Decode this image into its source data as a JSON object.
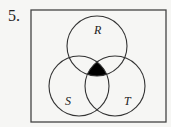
{
  "problem": {
    "number": "5."
  },
  "diagram": {
    "type": "venn",
    "universe": {
      "x": 31,
      "y": 10,
      "width": 135,
      "height": 112
    },
    "sets": [
      {
        "label": "R",
        "cx": 97,
        "cy": 46,
        "r": 30
      },
      {
        "label": "S",
        "cx": 79,
        "cy": 86,
        "r": 30
      },
      {
        "label": "T",
        "cx": 115,
        "cy": 86,
        "r": 30
      }
    ],
    "shaded_region": "R ∩ S ∩ T",
    "colors": {
      "stroke": "#333333",
      "shade": "#000000",
      "background": "#f6f6f4"
    }
  }
}
